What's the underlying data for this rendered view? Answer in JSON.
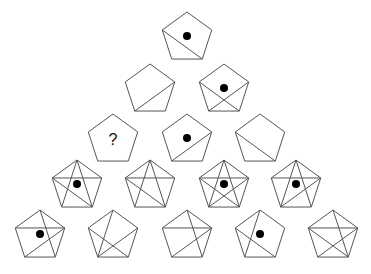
{
  "puzzle": {
    "description": "Pentagon pyramid pattern puzzle",
    "radius": 26,
    "line_color": "#555555",
    "dot_color": "#000000",
    "question_mark": "?",
    "rows": [
      {
        "y": 34,
        "cells": [
          {
            "x": 187,
            "diagonals": [
              "L-BR"
            ],
            "dot": true
          }
        ]
      },
      {
        "y": 86,
        "cells": [
          {
            "x": 150,
            "diagonals": [
              "R-BL"
            ],
            "dot": false
          },
          {
            "x": 224,
            "diagonals": [
              "L-BR",
              "R-BL"
            ],
            "dot": true
          }
        ]
      },
      {
        "y": 136,
        "cells": [
          {
            "x": 113,
            "diagonals": [],
            "dot": false,
            "question": true
          },
          {
            "x": 187,
            "diagonals": [
              "R-BL"
            ],
            "dot": true
          },
          {
            "x": 260,
            "diagonals": [
              "L-BR"
            ],
            "dot": false
          }
        ]
      },
      {
        "y": 182,
        "cells": [
          {
            "x": 77,
            "diagonals": [
              "T-BL",
              "T-BR",
              "L-R",
              "L-BR"
            ],
            "dot": true
          },
          {
            "x": 150,
            "diagonals": [
              "T-BL",
              "T-BR",
              "L-R",
              "L-BR"
            ],
            "dot": false
          },
          {
            "x": 224,
            "diagonals": [
              "T-BL",
              "T-BR",
              "L-R",
              "L-BR",
              "R-BL"
            ],
            "dot": true
          },
          {
            "x": 296,
            "diagonals": [
              "T-BL",
              "T-BR",
              "L-R",
              "R-BL"
            ],
            "dot": true
          }
        ]
      },
      {
        "y": 232,
        "cells": [
          {
            "x": 40,
            "diagonals": [
              "T-BR",
              "L-R",
              "R-BL"
            ],
            "dot": true
          },
          {
            "x": 113,
            "diagonals": [
              "T-BL",
              "L-BR",
              "R-BL"
            ],
            "dot": false
          },
          {
            "x": 187,
            "diagonals": [
              "T-BR",
              "L-R",
              "R-BL"
            ],
            "dot": false
          },
          {
            "x": 260,
            "diagonals": [
              "T-BL",
              "L-BR"
            ],
            "dot": true
          },
          {
            "x": 333,
            "diagonals": [
              "T-BR",
              "L-R",
              "L-BR",
              "R-BL"
            ],
            "dot": false
          }
        ]
      }
    ]
  }
}
